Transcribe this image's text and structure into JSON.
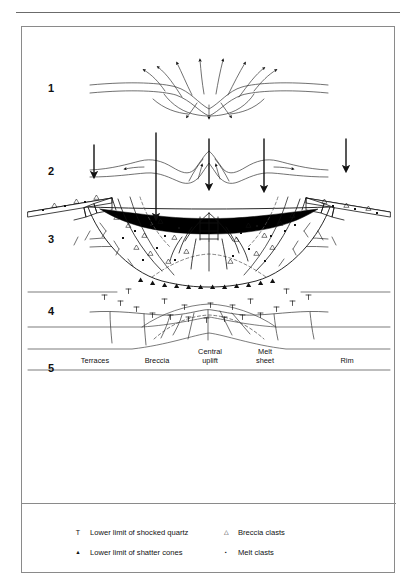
{
  "figure": {
    "type": "impact-crater-formation-sequence",
    "stages": [
      {
        "number": "1",
        "name": "excavation-transient-cavity"
      },
      {
        "number": "2",
        "name": "rebound-central-peak"
      },
      {
        "number": "3",
        "name": "collapse-central-uplift"
      },
      {
        "number": "4",
        "name": "final-fractured-surface"
      },
      {
        "number": "5",
        "name": "final-complex-crater-structure"
      }
    ],
    "annotations": [
      {
        "id": "terraces",
        "label": "Terraces",
        "marker": "down-arrow"
      },
      {
        "id": "breccia",
        "label": "Breccia",
        "marker": "down-arrow"
      },
      {
        "id": "central-uplift",
        "label": "Central\nuplift",
        "marker": "down-arrow"
      },
      {
        "id": "melt-sheet",
        "label": "Melt\nsheet",
        "marker": "down-arrow"
      },
      {
        "id": "rim",
        "label": "Rim",
        "marker": "down-arrow"
      }
    ],
    "legend": [
      {
        "symbol": "T",
        "symbol_name": "tee-symbol",
        "text": "Lower limit of shocked quartz"
      },
      {
        "symbol": "▲",
        "symbol_name": "small-triangle-symbol",
        "text": "Lower limit of shatter cones"
      },
      {
        "symbol": "△",
        "symbol_name": "open-triangle-symbol",
        "text": "Breccia clasts"
      },
      {
        "symbol": "▪",
        "symbol_name": "small-square-symbol",
        "text": "Melt clasts"
      }
    ],
    "colors": {
      "ink": "#111111",
      "melt_sheet_fill": "#000000",
      "rule": "#6b6b6b",
      "border": "#8a8a8a",
      "background": "#ffffff"
    }
  }
}
